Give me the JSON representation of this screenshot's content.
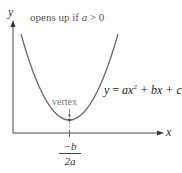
{
  "diagram": {
    "type": "parabola",
    "axes": {
      "x_label": "x",
      "y_label": "y"
    },
    "annotation_top": {
      "text_prefix": "opens up if ",
      "var": "a",
      "text_suffix": " > 0"
    },
    "vertex_label": "vertex",
    "equation": {
      "lhs": "y",
      "eq": " = ",
      "a": "ax",
      "exp": "2",
      "rest": " + bx + c"
    },
    "vertex_x": {
      "numerator": "−b",
      "denominator": "2a"
    },
    "colors": {
      "curve": "#6a6a6a",
      "axis": "#444444",
      "text": "#555555"
    }
  }
}
